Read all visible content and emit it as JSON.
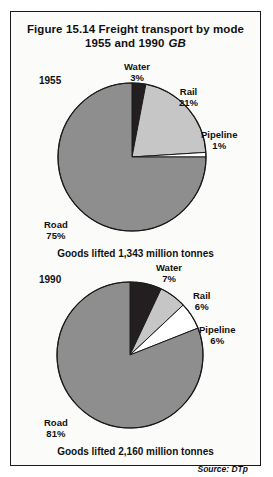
{
  "figure": {
    "title_line1": "Figure 15.14   Freight transport by mode",
    "title_line2": "1955 and 1990",
    "title_region": "GB",
    "source": "Source: DTp",
    "border_color": "#1a1a1a",
    "background": "#fbfbfa"
  },
  "colors": {
    "road": "#8e8e8e",
    "rail": "#c6c6c6",
    "water": "#231f20",
    "pipeline": "#ffffff",
    "outline": "#1a1a1a"
  },
  "chart_data": [
    {
      "type": "pie",
      "title": "1955",
      "year": "1955",
      "caption": "Goods lifted 1,343 million tonnes",
      "total_label": "1,343 million tonnes",
      "categories": [
        "Water",
        "Rail",
        "Pipeline",
        "Road"
      ],
      "values": [
        3,
        21,
        1,
        75
      ],
      "units": "percent",
      "slices": [
        {
          "name": "Water",
          "label": "Water",
          "percent_label": "3%",
          "value": 3,
          "color": "#231f20"
        },
        {
          "name": "Rail",
          "label": "Rail",
          "percent_label": "21%",
          "value": 21,
          "color": "#c6c6c6"
        },
        {
          "name": "Pipeline",
          "label": "Pipeline",
          "percent_label": "1%",
          "value": 1,
          "color": "#ffffff"
        },
        {
          "name": "Road",
          "label": "Road",
          "percent_label": "75%",
          "value": 75,
          "color": "#8e8e8e"
        }
      ],
      "start_angle_deg": 0,
      "legend": "labels-outside"
    },
    {
      "type": "pie",
      "title": "1990",
      "year": "1990",
      "caption": "Goods lifted 2,160 million tonnes",
      "total_label": "2,160 million tonnes",
      "categories": [
        "Water",
        "Rail",
        "Pipeline",
        "Road"
      ],
      "values": [
        7,
        6,
        6,
        81
      ],
      "units": "percent",
      "slices": [
        {
          "name": "Water",
          "label": "Water",
          "percent_label": "7%",
          "value": 7,
          "color": "#231f20"
        },
        {
          "name": "Rail",
          "label": "Rail",
          "percent_label": "6%",
          "value": 6,
          "color": "#c6c6c6"
        },
        {
          "name": "Pipeline",
          "label": "Pipeline",
          "percent_label": "6%",
          "value": 6,
          "color": "#ffffff"
        },
        {
          "name": "Road",
          "label": "Road",
          "percent_label": "81%",
          "value": 81,
          "color": "#8e8e8e"
        }
      ],
      "start_angle_deg": 0,
      "legend": "labels-outside"
    }
  ]
}
